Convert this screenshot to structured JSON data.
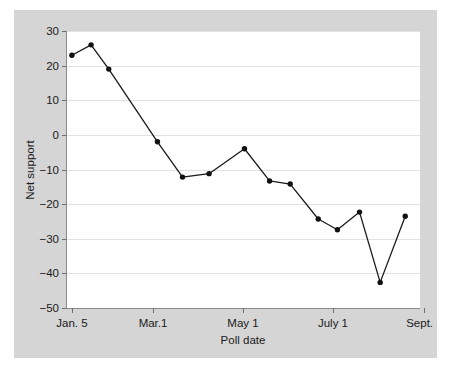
{
  "figure": {
    "background_color": "#d5d5d5",
    "plot_background_color": "#ffffff",
    "gridline_color": "#e2e2e2",
    "series_color": "#111111"
  },
  "chart_data": {
    "type": "line",
    "title": "",
    "xlabel": "Poll date",
    "ylabel": "Net support",
    "grid": "horizontal",
    "legend": "none",
    "xlim": [
      0,
      240
    ],
    "ylim": [
      -50,
      30
    ],
    "yticks": [
      30,
      20,
      10,
      0,
      -10,
      -20,
      -30,
      -40,
      -50
    ],
    "ytick_labels": [
      "30",
      "20",
      "10",
      "0",
      "−10",
      "−20",
      "−30",
      "−40",
      "−50"
    ],
    "xticks": [
      4,
      59,
      120,
      181,
      243
    ],
    "xtick_labels": [
      "Jan. 5",
      "Mar.1",
      "May 1",
      "July 1",
      "Sept. 1"
    ],
    "x": [
      4,
      18,
      29,
      62,
      78,
      98,
      115,
      132,
      148,
      165,
      176,
      196,
      208,
      219,
      228
    ],
    "y": [
      23,
      26,
      19,
      -2,
      -12.2,
      -11.2,
      -4,
      -13.3,
      -14.2,
      -24.3,
      -27.4,
      -22.3,
      -42.6,
      -23.5
    ],
    "points": [
      {
        "x": 4,
        "y": 23
      },
      {
        "x": 17,
        "y": 26
      },
      {
        "x": 29,
        "y": 19
      },
      {
        "x": 62,
        "y": -2
      },
      {
        "x": 79,
        "y": -12.2
      },
      {
        "x": 97,
        "y": -11.2
      },
      {
        "x": 121,
        "y": -4
      },
      {
        "x": 138,
        "y": -13.3
      },
      {
        "x": 152,
        "y": -14.2
      },
      {
        "x": 171,
        "y": -24.3
      },
      {
        "x": 184,
        "y": -27.4
      },
      {
        "x": 199,
        "y": -22.3
      },
      {
        "x": 213,
        "y": -42.6
      },
      {
        "x": 230,
        "y": -23.5
      }
    ]
  }
}
